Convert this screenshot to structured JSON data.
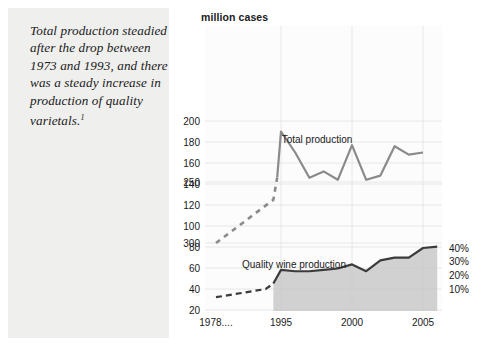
{
  "caption": {
    "text": "Total production steadied after the drop between 1973 and 1993, and there was a steady increase in production of quality varietals.",
    "footnote_marker": "1"
  },
  "chart_data": {
    "type": "line",
    "title": "",
    "ylabel": "million cases",
    "xlabel": "",
    "grid": true,
    "legend": "inline-annotations",
    "colors": {
      "total_line": "#8a8a8a",
      "quality_line": "#3b3b3b",
      "quality_fill": "#c9c9c9",
      "grid": "#e2e2e2",
      "text": "#1a1a1a",
      "panel_bg": "#efefee"
    },
    "y_axis_left": {
      "label": "million cases",
      "ticks": [
        300,
        250,
        200,
        180,
        160,
        140,
        120,
        100,
        80,
        60,
        40,
        20
      ],
      "note": "non-linear: break between 200 and 250"
    },
    "y_axis_right": {
      "ticks": [
        "40%",
        "30%",
        "20%",
        "10%"
      ],
      "values": [
        40,
        30,
        20,
        10
      ]
    },
    "x_axis": {
      "ticks": [
        "1978....",
        "1995",
        "2000",
        "2005"
      ],
      "tick_years": [
        1978,
        1995,
        2000,
        2005
      ]
    },
    "series": [
      {
        "name": "Total production",
        "unit": "million cases",
        "style": "line",
        "dashed_start": true,
        "points": [
          {
            "year": 1978,
            "value": 300,
            "dashed": true
          },
          {
            "year": 1993,
            "value": 125,
            "dashed": true
          },
          {
            "year": 1994,
            "value": 146
          },
          {
            "year": 1995,
            "value": 190
          },
          {
            "year": 1996,
            "value": 170
          },
          {
            "year": 1997,
            "value": 146
          },
          {
            "year": 1998,
            "value": 152
          },
          {
            "year": 1999,
            "value": 144
          },
          {
            "year": 2000,
            "value": 177
          },
          {
            "year": 2001,
            "value": 144
          },
          {
            "year": 2002,
            "value": 148
          },
          {
            "year": 2003,
            "value": 176
          },
          {
            "year": 2004,
            "value": 168
          },
          {
            "year": 2005,
            "value": 170
          }
        ]
      },
      {
        "name": "Quality wine production",
        "unit": "percent",
        "style": "area",
        "dashed_start": true,
        "points": [
          {
            "year": 1978,
            "value": 4,
            "dashed": true
          },
          {
            "year": 1991,
            "value": 10,
            "dashed": true
          },
          {
            "year": 1993,
            "value": 14
          },
          {
            "year": 1995,
            "value": 24
          },
          {
            "year": 1996,
            "value": 23
          },
          {
            "year": 1997,
            "value": 23
          },
          {
            "year": 1998,
            "value": 24
          },
          {
            "year": 1999,
            "value": 25
          },
          {
            "year": 2000,
            "value": 28
          },
          {
            "year": 2001,
            "value": 23
          },
          {
            "year": 2002,
            "value": 31
          },
          {
            "year": 2003,
            "value": 33
          },
          {
            "year": 2004,
            "value": 33
          },
          {
            "year": 2005,
            "value": 40
          },
          {
            "year": 2006,
            "value": 41
          }
        ]
      }
    ],
    "annotations": [
      {
        "name": "total-production-label",
        "text": "Total production"
      },
      {
        "name": "quality-wine-label",
        "text": "Quality wine production"
      }
    ]
  }
}
